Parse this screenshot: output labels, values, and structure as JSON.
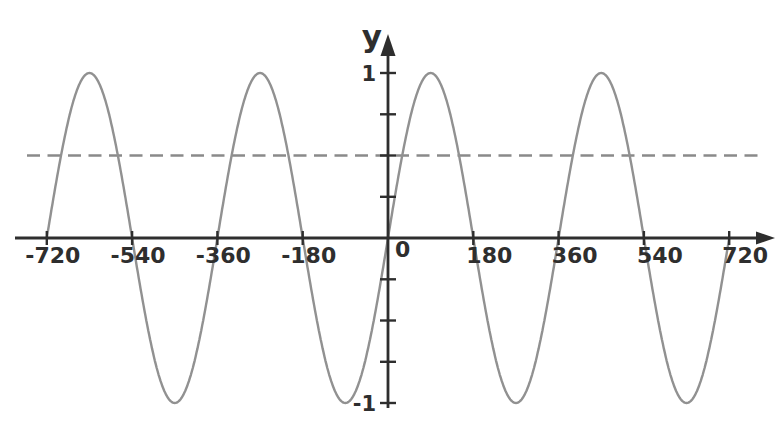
{
  "chart_data": {
    "type": "line",
    "title": "",
    "xlabel": "",
    "ylabel": "y",
    "origin_label": "0",
    "x_unit": "degrees",
    "xlim": [
      -720,
      720
    ],
    "ylim": [
      -1,
      1
    ],
    "grid": false,
    "legend": null,
    "x_tick_values": [
      -720,
      -540,
      -360,
      -180,
      180,
      360,
      540,
      720
    ],
    "x_tick_labels": [
      "-720",
      "-540",
      "-360",
      "-180",
      "180",
      "360",
      "540",
      "720"
    ],
    "y_tick_values": [
      -1,
      -0.75,
      -0.5,
      -0.25,
      0.25,
      0.5,
      0.75,
      1
    ],
    "y_tick_labels": [
      {
        "value": 1,
        "label": "1"
      },
      {
        "value": -1,
        "label": "-1"
      }
    ],
    "series": [
      {
        "name": "y = sin(x)",
        "function": "sine_degrees",
        "amplitude": 1,
        "period_degrees": 360,
        "phase_degrees": 0,
        "domain_degrees": [
          -720,
          720
        ],
        "key_points": {
          "x": [
            -720,
            -630,
            -540,
            -450,
            -360,
            -270,
            -180,
            -90,
            0,
            90,
            180,
            270,
            360,
            450,
            540,
            630,
            720
          ],
          "y": [
            0,
            1,
            0,
            -1,
            0,
            1,
            0,
            -1,
            0,
            1,
            0,
            -1,
            0,
            1,
            0,
            -1,
            0
          ]
        },
        "color": "#919191"
      }
    ],
    "guide_line": {
      "y": 0.5,
      "style": "dashed",
      "color": "#8a8a8a"
    },
    "colors": {
      "axis": "#2e2e2e",
      "background": "#ffffff"
    }
  }
}
